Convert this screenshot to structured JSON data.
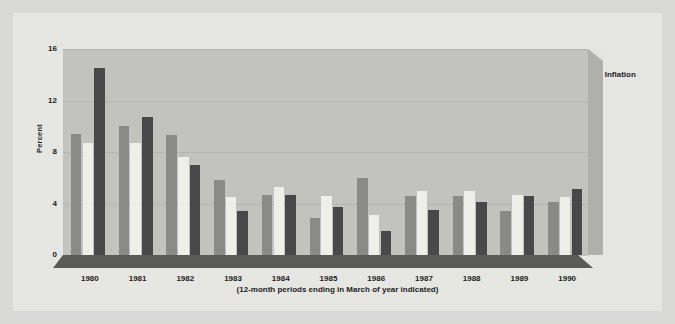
{
  "chart_data": {
    "type": "bar",
    "title": "",
    "subtitle": "(12-month periods ending in March of year indicated)",
    "xlabel": "",
    "ylabel": "Percent",
    "categories": [
      "1980",
      "1981",
      "1982",
      "1983",
      "1984",
      "1985",
      "1986",
      "1987",
      "1988",
      "1989",
      "1990"
    ],
    "series": [
      {
        "name": "Union wage increases",
        "color": "#8a8a88",
        "values": [
          9.4,
          10.0,
          9.3,
          5.8,
          4.7,
          2.9,
          6.0,
          4.6,
          4.6,
          3.4,
          4.1
        ]
      },
      {
        "name": "Nonunion wage increases",
        "color": "#eeeeea",
        "values": [
          8.7,
          8.7,
          7.6,
          4.5,
          5.3,
          4.6,
          3.1,
          5.0,
          5.0,
          4.7,
          4.5
        ]
      },
      {
        "name": "Inflation",
        "color": "#48484a",
        "values": [
          14.5,
          10.7,
          7.0,
          3.4,
          4.7,
          3.7,
          1.9,
          3.5,
          4.1,
          4.6,
          5.1
        ]
      }
    ],
    "ylim": [
      0,
      16
    ],
    "yticks": [
      "16",
      "12",
      "8",
      "4",
      "0"
    ],
    "ytick_values": [
      16,
      12,
      8,
      4,
      0
    ],
    "grid": true,
    "legend_position": "top-center"
  },
  "legend": {
    "items": [
      {
        "label": "Union wage increases",
        "swatch": "union"
      },
      {
        "label": "Nonunion wage increases",
        "swatch": "nonunion"
      },
      {
        "label": "Inflation",
        "swatch": "inflation"
      }
    ]
  },
  "colors": {
    "page_background": "#d9d9d7",
    "card_background": "#e6e6e3",
    "plot_wall": "#c2c2be",
    "base_slab": "#4f4f4d",
    "gridline": "#b4b4b0",
    "text": "#1d1d1d"
  }
}
